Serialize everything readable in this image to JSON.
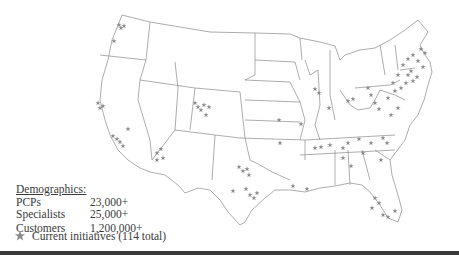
{
  "figure": {
    "cut_title": "Regions with current initiatives — geographic coverage"
  },
  "legend": {
    "title": "Demographics:",
    "rows": [
      {
        "label": "PCPs",
        "value": "23,000+"
      },
      {
        "label": "Specialists",
        "value": "25,000+"
      },
      {
        "label": "Customers",
        "value": "1,200,000+"
      }
    ]
  },
  "key": {
    "icon": "star-icon",
    "label": "Current initiatives (114 total)"
  },
  "colors": {
    "star": "#8a8a8a",
    "state_border": "#8a8a8a",
    "rule": "#3a3a3a"
  }
}
